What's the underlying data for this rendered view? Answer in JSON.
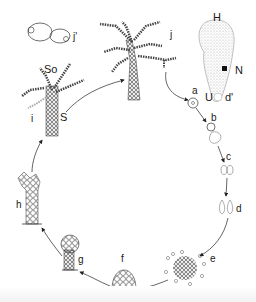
{
  "diagram": {
    "type": "life-cycle",
    "stages": [
      {
        "id": "a",
        "label": "a"
      },
      {
        "id": "b",
        "label": "b"
      },
      {
        "id": "c",
        "label": "c"
      },
      {
        "id": "d",
        "label": "d"
      },
      {
        "id": "e",
        "label": "e"
      },
      {
        "id": "f",
        "label": "f"
      },
      {
        "id": "g",
        "label": "g"
      },
      {
        "id": "h",
        "label": "h"
      },
      {
        "id": "i",
        "label": "i"
      },
      {
        "id": "j",
        "label": "j"
      }
    ],
    "extra_labels": {
      "j_prime": "j'",
      "d_prime": "d'",
      "So": "So",
      "S": "S",
      "H": "H",
      "N": "N",
      "U": "U"
    },
    "colors": {
      "ink": "#1a1a1a",
      "stipple": "#bdbdbd",
      "background": "#ffffff"
    }
  }
}
